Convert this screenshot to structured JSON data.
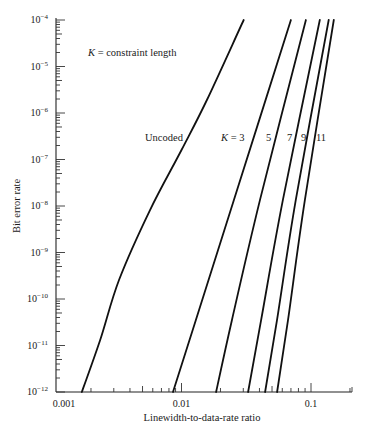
{
  "chart_data": {
    "type": "line",
    "title": "",
    "xlabel": "Linewidth-to-data-rate ratio",
    "ylabel": "Bit error rate",
    "xscale": "log",
    "yscale": "log",
    "xlim": [
      0.001,
      0.2
    ],
    "ylim": [
      1e-12,
      0.0001
    ],
    "x_tick_labels": [
      "0.001",
      "0.01",
      "0.1"
    ],
    "x_ticks": [
      0.001,
      0.01,
      0.1
    ],
    "y_tick_labels": [
      {
        "base": "10",
        "exp": "−4",
        "value": 0.0001
      },
      {
        "base": "10",
        "exp": "−5",
        "value": 1e-05
      },
      {
        "base": "10",
        "exp": "−6",
        "value": 1e-06
      },
      {
        "base": "10",
        "exp": "−7",
        "value": 1e-07
      },
      {
        "base": "10",
        "exp": "−8",
        "value": 1e-08
      },
      {
        "base": "10",
        "exp": "−9",
        "value": 1e-09
      },
      {
        "base": "10",
        "exp": "−10",
        "value": 1e-10
      },
      {
        "base": "10",
        "exp": "−11",
        "value": 1e-11
      },
      {
        "base": "10",
        "exp": "−12",
        "value": 1e-12
      }
    ],
    "grid": false,
    "legend": null,
    "annotations": [
      {
        "text_italic": "K",
        "text": " = constraint length",
        "position": "upper-left"
      }
    ],
    "series": [
      {
        "name": "Uncoded",
        "label": "Uncoded",
        "x": [
          0.0017,
          0.00235,
          0.0033,
          0.0057,
          0.01,
          0.0157,
          0.0302
        ],
        "y": [
          1e-12,
          1.3e-11,
          2.6e-10,
          8.1e-09,
          1.6e-07,
          1.9e-06,
          0.0001
        ]
      },
      {
        "name": "K = 3",
        "label_italic": "K",
        "label": " = 3",
        "x": [
          0.0086,
          0.0129,
          0.0254,
          0.07
        ],
        "y": [
          1e-12,
          3.5e-11,
          1.35e-08,
          0.0001
        ]
      },
      {
        "name": "K = 5",
        "label": "5",
        "x": [
          0.0185,
          0.0245,
          0.0404,
          0.0913
        ],
        "y": [
          1e-12,
          3.5e-11,
          1.35e-08,
          0.0001
        ]
      },
      {
        "name": "K = 7",
        "label": "7",
        "x": [
          0.0327,
          0.0412,
          0.0607,
          0.117
        ],
        "y": [
          1e-12,
          3.5e-11,
          1.35e-08,
          0.0001
        ]
      },
      {
        "name": "K = 9",
        "label": "9",
        "x": [
          0.0442,
          0.0546,
          0.0763,
          0.137
        ],
        "y": [
          1e-12,
          3.5e-11,
          1.35e-08,
          0.0001
        ]
      },
      {
        "name": "K = 11",
        "label": "11",
        "x": [
          0.0547,
          0.0664,
          0.0897,
          0.15
        ],
        "y": [
          1e-12,
          3.5e-11,
          1.35e-08,
          0.0001
        ]
      }
    ]
  },
  "layout": {
    "plot_left_px": 52,
    "x_decade_px": 129.5,
    "plot_top_px": 20,
    "y_decade_px": 46.5,
    "x_axis_y_px": 392,
    "x_axis_end_px": 352,
    "y_axis_x_px": 56
  },
  "labels": {
    "constraint_note_k": "K",
    "constraint_note_rest": " = constraint length",
    "uncoded": "Uncoded",
    "k3_k": "K",
    "k3_rest": " = 3",
    "k5": "5",
    "k7": "7",
    "k9": "9",
    "k11": "11",
    "x_axis_title": "Linewidth-to-data-rate ratio",
    "y_axis_title": "Bit error rate"
  }
}
